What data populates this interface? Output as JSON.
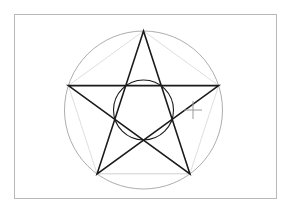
{
  "app": {
    "title": "Drawing Canvas",
    "background_color": "#ffffff"
  },
  "canvas": {
    "name": "drawing-canvas",
    "frame": {
      "x": 14,
      "y": 14,
      "width": 263,
      "height": 185,
      "border_color": "#b8b8b8",
      "fill_color": "#ffffff"
    }
  },
  "geometry": {
    "center": {
      "x": 143.5,
      "y": 110
    },
    "outer_circle": {
      "name": "circumscribed-circle",
      "cx": 143.5,
      "cy": 110,
      "r": 79,
      "stroke": "#8a8a8a",
      "stroke_width": 0.7,
      "fill": "none"
    },
    "inner_circle": {
      "name": "inner-circle",
      "cx": 143.5,
      "cy": 110,
      "r": 30,
      "stroke": "#1a1a1a",
      "stroke_width": 1.1,
      "fill": "none"
    },
    "vertices": [
      {
        "label": "top",
        "x": 143.5,
        "y": 31
      },
      {
        "label": "right",
        "x": 218.6,
        "y": 85.6
      },
      {
        "label": "bottom-right",
        "x": 189.9,
        "y": 173.8
      },
      {
        "label": "bottom-left",
        "x": 97.1,
        "y": 173.8
      },
      {
        "label": "left",
        "x": 68.4,
        "y": 85.6
      }
    ],
    "pentagram": {
      "name": "pentagram-star",
      "points_order": [
        0,
        2,
        4,
        1,
        3
      ],
      "stroke": "#1a1a1a",
      "stroke_width": 1.6,
      "fill": "none"
    },
    "pentagon": {
      "name": "construction-pentagon",
      "stroke": "#bdbdbd",
      "stroke_width": 0.7,
      "fill": "none"
    },
    "construction_chords": {
      "name": "construction-chords",
      "stroke": "#c8c8c8",
      "stroke_width": 0.6
    }
  },
  "cursor": {
    "name": "crosshair-cursor",
    "x": 193,
    "y": 110,
    "arm_length": 9,
    "color": "#9a9a9a",
    "stroke_width": 1
  }
}
